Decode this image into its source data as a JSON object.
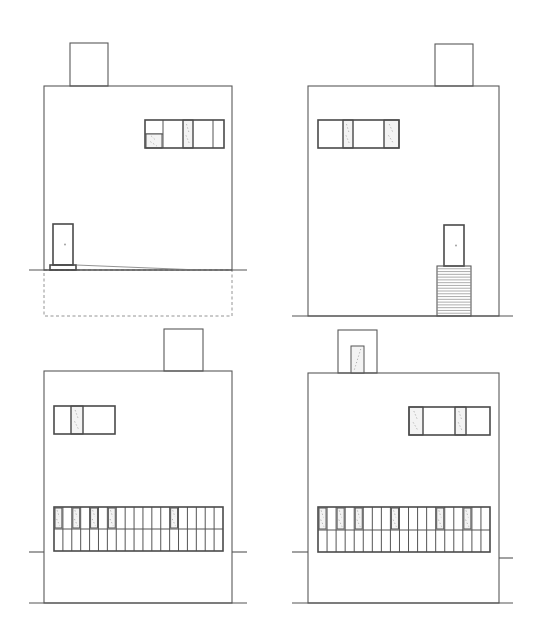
{
  "drawing": {
    "type": "architectural-elevations",
    "background": "#ffffff",
    "line_color": "#5a5a5a",
    "elevations": [
      {
        "id": "elevation-top-left",
        "building": {
          "x": 44,
          "y": 86,
          "w": 188,
          "h": 184
        },
        "chimney": {
          "x": 70,
          "y": 43,
          "w": 38,
          "h": 43
        },
        "ground": {
          "y": 270,
          "x1": 29,
          "x2": 247
        },
        "foundation_dashed": {
          "x": 44,
          "y": 270,
          "w": 188,
          "h": 46
        },
        "window": {
          "x": 145,
          "y": 120,
          "w": 79,
          "h": 28,
          "panels": [
            {
              "x": 145,
              "w": 18,
              "type": "split",
              "split_y": 134
            },
            {
              "x": 163,
              "w": 20,
              "type": "clear"
            },
            {
              "x": 183,
              "w": 10,
              "type": "glazed"
            },
            {
              "x": 193,
              "w": 20,
              "type": "clear"
            },
            {
              "x": 213,
              "w": 11,
              "type": "clear"
            }
          ]
        },
        "door": {
          "x": 53,
          "y": 224,
          "w": 20,
          "h": 41
        },
        "step": {
          "x": 50,
          "y": 265,
          "w": 26,
          "h": 5
        },
        "ramp": {
          "x1": 76,
          "y1": 265,
          "x2": 200,
          "y2": 270
        }
      },
      {
        "id": "elevation-top-right",
        "building": {
          "x": 308,
          "y": 86,
          "w": 191,
          "h": 230
        },
        "chimney": {
          "x": 435,
          "y": 44,
          "w": 38,
          "h": 42
        },
        "ground": {
          "y": 316,
          "x1": 292,
          "x2": 513
        },
        "window": {
          "x": 318,
          "y": 120,
          "w": 81,
          "h": 28,
          "panels": [
            {
              "x": 318,
              "w": 25,
              "type": "clear"
            },
            {
              "x": 343,
              "w": 10,
              "type": "glazed"
            },
            {
              "x": 353,
              "w": 31,
              "type": "clear"
            },
            {
              "x": 384,
              "w": 15,
              "type": "glazed"
            }
          ]
        },
        "door": {
          "x": 444,
          "y": 225,
          "w": 20,
          "h": 41
        },
        "stair": {
          "x": 437,
          "y": 266,
          "w": 34,
          "h": 50,
          "treads": 18
        }
      },
      {
        "id": "elevation-bottom-left",
        "building": {
          "x": 44,
          "y": 371,
          "w": 188,
          "h": 232
        },
        "chimney": {
          "x": 164,
          "y": 329,
          "w": 39,
          "h": 42
        },
        "ground": {
          "y": 603,
          "x1": 29,
          "x2": 247
        },
        "side_lines": [
          {
            "x1": 29,
            "x2": 44,
            "y": 552
          },
          {
            "x1": 232,
            "x2": 247,
            "y": 552
          }
        ],
        "window": {
          "x": 54,
          "y": 406,
          "w": 61,
          "h": 28,
          "panels": [
            {
              "x": 54,
              "w": 17,
              "type": "clear"
            },
            {
              "x": 71,
              "w": 12,
              "type": "glazed"
            },
            {
              "x": 83,
              "w": 32,
              "type": "clear"
            }
          ]
        },
        "strip_window": {
          "x": 54,
          "y": 507,
          "w": 169,
          "h": 44,
          "columns": 19,
          "mid_rail_y": 529,
          "glazed_columns": [
            0,
            2,
            4,
            6,
            13
          ]
        }
      },
      {
        "id": "elevation-bottom-right",
        "building": {
          "x": 308,
          "y": 373,
          "w": 191,
          "h": 230
        },
        "chimney": {
          "x": 338,
          "y": 330,
          "w": 39,
          "h": 43
        },
        "chimney_opening": {
          "x": 351,
          "y": 346,
          "w": 13,
          "h": 27
        },
        "ground": {
          "y": 603,
          "x1": 292,
          "x2": 513
        },
        "side_lines": [
          {
            "x1": 292,
            "x2": 308,
            "y": 552
          },
          {
            "x1": 499,
            "x2": 513,
            "y": 558
          }
        ],
        "window": {
          "x": 409,
          "y": 407,
          "w": 81,
          "h": 28,
          "panels": [
            {
              "x": 409,
              "w": 14,
              "type": "glazed"
            },
            {
              "x": 423,
              "w": 32,
              "type": "clear"
            },
            {
              "x": 455,
              "w": 11,
              "type": "glazed"
            },
            {
              "x": 466,
              "w": 24,
              "type": "clear"
            }
          ]
        },
        "strip_window": {
          "x": 318,
          "y": 507,
          "w": 172,
          "h": 45,
          "columns": 19,
          "mid_rail_y": 530,
          "glazed_columns": [
            0,
            2,
            4,
            8,
            13,
            16
          ]
        }
      }
    ]
  }
}
